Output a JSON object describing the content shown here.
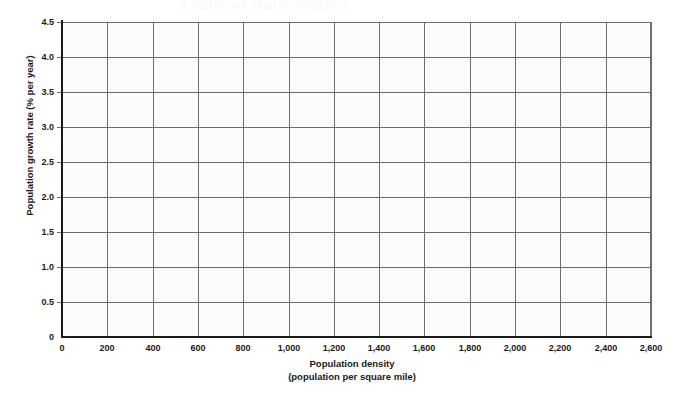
{
  "figure": {
    "ghost_header": "Applying Mathematics",
    "background_color": "#ffffff",
    "plot_background_color": "#fbfbfb",
    "grid_color": "#6d6d6d",
    "axis_color": "#1a1a1a"
  },
  "chart_data": {
    "type": "scatter",
    "title": "",
    "subtitle": "",
    "xlabel": "Population density",
    "xlabel_sub": "(population per square mile)",
    "ylabel": "Population growth rate (% per year)",
    "xlim": [
      0,
      2600
    ],
    "ylim": [
      0,
      4.5
    ],
    "xticks": [
      0,
      200,
      400,
      600,
      800,
      1000,
      1200,
      1400,
      1600,
      1800,
      2000,
      2200,
      2400,
      2600
    ],
    "xticklabels": [
      "0",
      "200",
      "400",
      "600",
      "800",
      "1,000",
      "1,200",
      "1,400",
      "1,600",
      "1,800",
      "2,000",
      "2,200",
      "2,400",
      "2,600"
    ],
    "yticks": [
      0,
      0.5,
      1.0,
      1.5,
      2.0,
      2.5,
      3.0,
      3.5,
      4.0,
      4.5
    ],
    "yticklabels": [
      "0",
      "0.5",
      "1.0",
      "1.5",
      "2.0",
      "2.5",
      "3.0",
      "3.5",
      "4.0",
      "4.5"
    ],
    "grid": true,
    "grid_axis": "both",
    "legend": null,
    "series": [],
    "values": [],
    "annotations": [],
    "note": "Blank grid worksheet — no data points are plotted."
  }
}
